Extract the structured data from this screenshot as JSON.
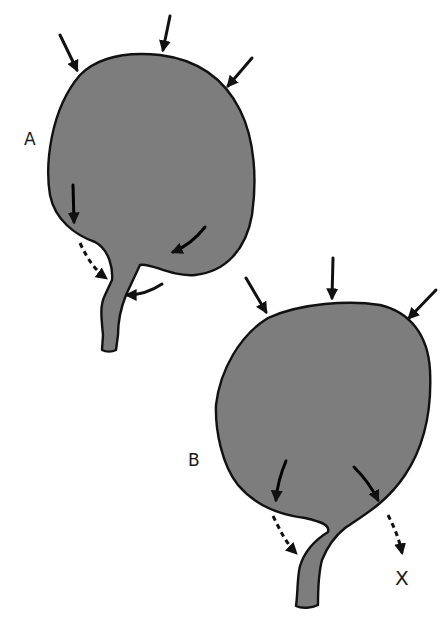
{
  "figure": {
    "panels": [
      {
        "id": "A",
        "label": "A"
      },
      {
        "id": "B",
        "label": "B"
      }
    ],
    "annotations": {
      "x_mark": "X"
    },
    "colors": {
      "fill": "#7d7d7d",
      "outline": "#111111",
      "background": "#ffffff"
    }
  }
}
